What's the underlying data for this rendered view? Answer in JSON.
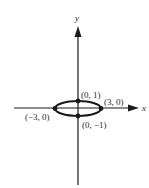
{
  "diagram": {
    "type": "ellipse-on-axes",
    "axes": {
      "x_label": "x",
      "y_label": "y"
    },
    "points": [
      {
        "label": "(0, 1)"
      },
      {
        "label": "(3, 0)"
      },
      {
        "label": "(−3, 0)"
      },
      {
        "label": "(0, −1)"
      }
    ],
    "colors": {
      "stroke": "#1a1a1a",
      "text": "#2a2a2a",
      "background": "#ffffff"
    }
  }
}
